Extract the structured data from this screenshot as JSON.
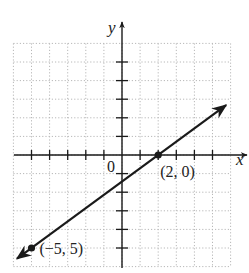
{
  "chart_data": {
    "type": "line",
    "title": "",
    "xlabel": "x",
    "ylabel": "y",
    "origin_label": "0",
    "xlim": [
      -6,
      6
    ],
    "ylim": [
      -6,
      6
    ],
    "grid": true,
    "grid_style": "dotted",
    "tick_step": 1,
    "series": [
      {
        "name": "line",
        "x": [
          -5,
          2
        ],
        "y": [
          -5,
          0
        ],
        "arrows_both_ends": true
      }
    ],
    "points": [
      {
        "x": 2,
        "y": 0,
        "label": "(2, 0)"
      },
      {
        "x": -5,
        "y": -5,
        "label": "(−5, 5)"
      }
    ],
    "colors": {
      "line": "#1a1a1a",
      "grid": "#b8b8b8",
      "axis": "#1a1a1a"
    }
  }
}
